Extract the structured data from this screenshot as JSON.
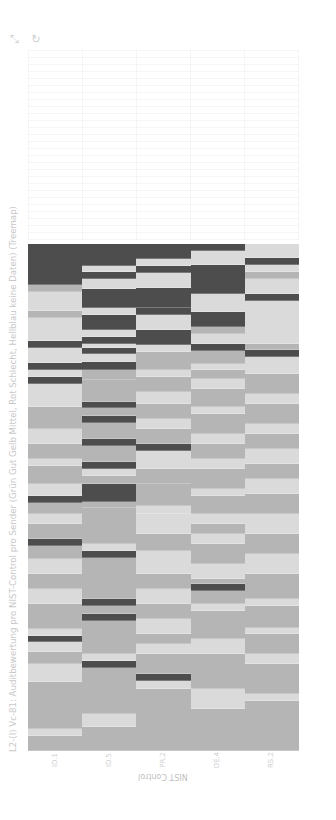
{
  "toolbar": {
    "icons": [
      {
        "name": "pan-icon",
        "glyph": "⤡"
      },
      {
        "name": "reset-icon",
        "glyph": "↻"
      }
    ]
  },
  "colors": {
    "bad": "#4d4d4d",
    "good": "#dadada",
    "medium": "#b5b5b5"
  },
  "chart_data": {
    "type": "heatmap",
    "title": "L2-(I) Vc-81: Auditbewertung pro NIST-Control pro Sender (Grün Gut Gelb Mittel, Rot Schlecht, Hellblau keine Daten) (Treemap)",
    "xlabel": "NIST Control",
    "ylabel": "",
    "categories": [
      "ID.1",
      "ID.5",
      "PR.2",
      "DE.4",
      "RS.2"
    ],
    "legend": [
      "Gut",
      "Mittel",
      "Schlecht",
      "keine Daten"
    ],
    "value_encoding": {
      "D": "Schlecht",
      "L": "Gut",
      "M": "Mittel"
    },
    "grid": true,
    "columns": [
      {
        "category": "ID.1",
        "segments": [
          [
            0,
            41,
            "D"
          ],
          [
            41,
            48,
            "M"
          ],
          [
            48,
            67,
            "L"
          ],
          [
            67,
            74,
            "M"
          ],
          [
            74,
            97,
            "L"
          ],
          [
            97,
            104,
            "D"
          ],
          [
            104,
            119,
            "L"
          ],
          [
            119,
            126,
            "D"
          ],
          [
            126,
            133,
            "L"
          ],
          [
            133,
            140,
            "D"
          ],
          [
            140,
            163,
            "L"
          ],
          [
            163,
            185,
            "M"
          ],
          [
            185,
            200,
            "L"
          ],
          [
            200,
            215,
            "M"
          ],
          [
            215,
            222,
            "L"
          ],
          [
            222,
            240,
            "M"
          ],
          [
            240,
            252,
            "L"
          ],
          [
            252,
            259,
            "D"
          ],
          [
            259,
            270,
            "M"
          ],
          [
            270,
            280,
            "L"
          ],
          [
            280,
            295,
            "M"
          ],
          [
            295,
            302,
            "D"
          ],
          [
            302,
            315,
            "M"
          ],
          [
            315,
            330,
            "L"
          ],
          [
            330,
            345,
            "M"
          ],
          [
            345,
            360,
            "L"
          ],
          [
            360,
            385,
            "M"
          ],
          [
            385,
            392,
            "L"
          ],
          [
            392,
            398,
            "D"
          ],
          [
            398,
            408,
            "L"
          ],
          [
            408,
            420,
            "M"
          ],
          [
            420,
            438,
            "L"
          ],
          [
            438,
            485,
            "M"
          ],
          [
            485,
            492,
            "L"
          ],
          [
            492,
            507,
            "M"
          ]
        ]
      },
      {
        "category": "ID.5",
        "segments": [
          [
            0,
            22,
            "D"
          ],
          [
            22,
            28,
            "L"
          ],
          [
            28,
            35,
            "D"
          ],
          [
            35,
            45,
            "L"
          ],
          [
            45,
            64,
            "D"
          ],
          [
            64,
            71,
            "L"
          ],
          [
            71,
            86,
            "D"
          ],
          [
            86,
            93,
            "L"
          ],
          [
            93,
            100,
            "D"
          ],
          [
            100,
            104,
            "L"
          ],
          [
            104,
            110,
            "D"
          ],
          [
            110,
            118,
            "L"
          ],
          [
            118,
            126,
            "D"
          ],
          [
            126,
            136,
            "M"
          ],
          [
            136,
            158,
            "M"
          ],
          [
            158,
            164,
            "D"
          ],
          [
            164,
            172,
            "M"
          ],
          [
            172,
            179,
            "D"
          ],
          [
            179,
            195,
            "M"
          ],
          [
            195,
            202,
            "D"
          ],
          [
            202,
            218,
            "M"
          ],
          [
            218,
            225,
            "D"
          ],
          [
            225,
            232,
            "L"
          ],
          [
            232,
            240,
            "M"
          ],
          [
            240,
            258,
            "D"
          ],
          [
            258,
            264,
            "M"
          ],
          [
            264,
            300,
            "M"
          ],
          [
            300,
            307,
            "L"
          ],
          [
            307,
            314,
            "D"
          ],
          [
            314,
            355,
            "M"
          ],
          [
            355,
            362,
            "D"
          ],
          [
            362,
            370,
            "M"
          ],
          [
            370,
            377,
            "D"
          ],
          [
            377,
            410,
            "M"
          ],
          [
            410,
            417,
            "L"
          ],
          [
            417,
            424,
            "D"
          ],
          [
            424,
            470,
            "M"
          ],
          [
            470,
            483,
            "L"
          ],
          [
            483,
            507,
            "M"
          ]
        ]
      },
      {
        "category": "ID.5b",
        "segments": [
          [
            0,
            15,
            "D"
          ],
          [
            15,
            22,
            "L"
          ],
          [
            22,
            29,
            "D"
          ],
          [
            29,
            44,
            "L"
          ],
          [
            44,
            64,
            "D"
          ],
          [
            64,
            71,
            "D"
          ],
          [
            71,
            86,
            "L"
          ],
          [
            86,
            101,
            "D"
          ],
          [
            101,
            108,
            "L"
          ],
          [
            108,
            126,
            "M"
          ],
          [
            126,
            133,
            "L"
          ],
          [
            133,
            148,
            "M"
          ],
          [
            148,
            160,
            "L"
          ],
          [
            160,
            175,
            "M"
          ],
          [
            175,
            185,
            "L"
          ],
          [
            185,
            200,
            "M"
          ],
          [
            200,
            207,
            "D"
          ],
          [
            207,
            225,
            "L"
          ],
          [
            225,
            240,
            "M"
          ],
          [
            240,
            262,
            "M"
          ],
          [
            262,
            270,
            "L"
          ],
          [
            270,
            290,
            "L"
          ],
          [
            290,
            307,
            "M"
          ],
          [
            307,
            330,
            "L"
          ],
          [
            330,
            345,
            "M"
          ],
          [
            345,
            360,
            "L"
          ],
          [
            360,
            375,
            "M"
          ],
          [
            375,
            390,
            "L"
          ],
          [
            390,
            400,
            "M"
          ],
          [
            400,
            410,
            "L"
          ],
          [
            410,
            430,
            "M"
          ],
          [
            430,
            437,
            "D"
          ],
          [
            437,
            445,
            "L"
          ],
          [
            445,
            507,
            "M"
          ]
        ]
      },
      {
        "category": "DE.4",
        "segments": [
          [
            0,
            7,
            "D"
          ],
          [
            7,
            21,
            "L"
          ],
          [
            21,
            50,
            "D"
          ],
          [
            50,
            68,
            "L"
          ],
          [
            68,
            83,
            "D"
          ],
          [
            83,
            90,
            "M"
          ],
          [
            90,
            100,
            "L"
          ],
          [
            100,
            107,
            "D"
          ],
          [
            107,
            120,
            "M"
          ],
          [
            120,
            126,
            "L"
          ],
          [
            126,
            135,
            "M"
          ],
          [
            135,
            145,
            "L"
          ],
          [
            145,
            163,
            "M"
          ],
          [
            163,
            170,
            "L"
          ],
          [
            170,
            190,
            "M"
          ],
          [
            190,
            200,
            "L"
          ],
          [
            200,
            215,
            "M"
          ],
          [
            215,
            225,
            "L"
          ],
          [
            225,
            245,
            "M"
          ],
          [
            245,
            252,
            "L"
          ],
          [
            252,
            270,
            "M"
          ],
          [
            270,
            280,
            "L"
          ],
          [
            280,
            290,
            "M"
          ],
          [
            290,
            300,
            "L"
          ],
          [
            300,
            320,
            "M"
          ],
          [
            320,
            335,
            "L"
          ],
          [
            335,
            340,
            "M"
          ],
          [
            340,
            347,
            "D"
          ],
          [
            347,
            360,
            "M"
          ],
          [
            360,
            367,
            "L"
          ],
          [
            367,
            395,
            "M"
          ],
          [
            395,
            410,
            "L"
          ],
          [
            410,
            445,
            "M"
          ],
          [
            445,
            465,
            "L"
          ],
          [
            465,
            507,
            "M"
          ]
        ]
      },
      {
        "category": "RS.2",
        "segments": [
          [
            0,
            14,
            "L"
          ],
          [
            14,
            21,
            "D"
          ],
          [
            21,
            28,
            "L"
          ],
          [
            28,
            35,
            "M"
          ],
          [
            35,
            50,
            "L"
          ],
          [
            50,
            57,
            "D"
          ],
          [
            57,
            100,
            "L"
          ],
          [
            100,
            106,
            "M"
          ],
          [
            106,
            113,
            "D"
          ],
          [
            113,
            130,
            "L"
          ],
          [
            130,
            150,
            "M"
          ],
          [
            150,
            160,
            "L"
          ],
          [
            160,
            180,
            "M"
          ],
          [
            180,
            190,
            "L"
          ],
          [
            190,
            205,
            "M"
          ],
          [
            205,
            220,
            "L"
          ],
          [
            220,
            235,
            "M"
          ],
          [
            235,
            250,
            "L"
          ],
          [
            250,
            270,
            "M"
          ],
          [
            270,
            290,
            "L"
          ],
          [
            290,
            310,
            "M"
          ],
          [
            310,
            330,
            "L"
          ],
          [
            330,
            355,
            "M"
          ],
          [
            355,
            362,
            "L"
          ],
          [
            362,
            384,
            "M"
          ],
          [
            384,
            390,
            "L"
          ],
          [
            390,
            410,
            "M"
          ],
          [
            410,
            420,
            "L"
          ],
          [
            420,
            450,
            "M"
          ],
          [
            450,
            457,
            "L"
          ],
          [
            457,
            507,
            "M"
          ]
        ]
      }
    ]
  }
}
